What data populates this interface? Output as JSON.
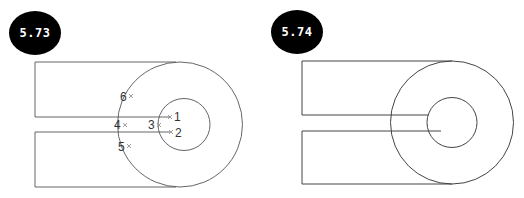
{
  "figures": [
    {
      "id": "fig-573",
      "badge": "5.73",
      "points": [
        {
          "label": "1",
          "x": 170,
          "y": 117
        },
        {
          "label": "2",
          "x": 171,
          "y": 132
        },
        {
          "label": "3",
          "x": 159,
          "y": 125
        },
        {
          "label": "4",
          "x": 125,
          "y": 125
        },
        {
          "label": "5",
          "x": 129,
          "y": 146
        },
        {
          "label": "6",
          "x": 131,
          "y": 96
        }
      ]
    },
    {
      "id": "fig-574",
      "badge": "5.74",
      "points": []
    }
  ],
  "colors": {
    "line": "#555555",
    "marker": "#888888",
    "badge_bg": "#000000",
    "badge_fg": "#ffffff"
  }
}
